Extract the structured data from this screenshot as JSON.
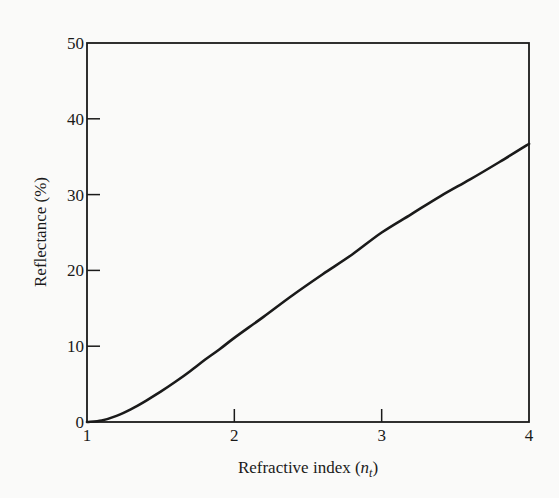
{
  "chart_data": {
    "type": "line",
    "title": "",
    "xlabel": "Refractive index (n_t)",
    "xlabel_main": "Refractive index (",
    "xlabel_var": "n",
    "xlabel_sub": "t",
    "xlabel_close": ")",
    "ylabel": "Reflectance (%)",
    "xlim": [
      1,
      4
    ],
    "ylim": [
      0,
      50
    ],
    "x_ticks": [
      1,
      2,
      3,
      4
    ],
    "y_ticks": [
      0,
      10,
      20,
      30,
      40,
      50
    ],
    "grid": false,
    "legend": null,
    "series": [
      {
        "name": "Reflectance",
        "x": [
          1.0,
          1.1,
          1.2,
          1.3,
          1.4,
          1.5,
          1.6,
          1.7,
          1.8,
          1.9,
          2.0,
          2.2,
          2.4,
          2.6,
          2.8,
          3.0,
          3.2,
          3.4,
          3.6,
          3.8,
          4.0
        ],
        "values": [
          0.0,
          0.2,
          0.8,
          1.7,
          2.8,
          4.0,
          5.3,
          6.7,
          8.2,
          9.6,
          11.1,
          13.9,
          16.8,
          19.5,
          22.1,
          25.0,
          27.4,
          29.8,
          32.0,
          34.3,
          36.7
        ]
      }
    ]
  },
  "colors": {
    "background": "#fafaf9",
    "ink": "#1a1a1a"
  }
}
